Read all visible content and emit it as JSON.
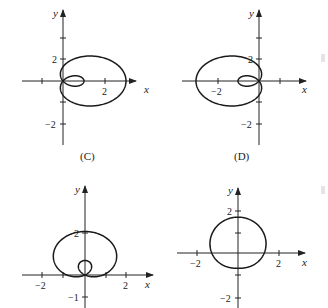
{
  "chart_data": [
    {
      "type": "line",
      "panel": "top-left",
      "title": "",
      "caption": "(C)",
      "description": "Limaçon with inner loop opening to the right",
      "equation_hint": "r = 1 + 2cos(theta)",
      "xlabel": "x",
      "ylabel": "y",
      "x_ticks": [
        {
          "value": -1,
          "label": ""
        },
        {
          "value": 2,
          "label": "2"
        }
      ],
      "y_ticks": [
        {
          "value": 4,
          "label": ""
        },
        {
          "value": 2,
          "label": "2"
        },
        {
          "value": -2,
          "label": "-2"
        },
        {
          "value": -4,
          "label": ""
        }
      ],
      "xlim": [
        -2,
        3.5
      ],
      "ylim": [
        -3,
        3
      ],
      "grid": false
    },
    {
      "type": "line",
      "panel": "top-right",
      "title": "",
      "caption": "(D)",
      "description": "Limaçon with inner loop opening to the left",
      "equation_hint": "r = 1 - 2cos(theta)",
      "xlabel": "x",
      "ylabel": "y",
      "x_ticks": [
        {
          "value": -2,
          "label": "-2"
        },
        {
          "value": 1,
          "label": ""
        }
      ],
      "y_ticks": [
        {
          "value": 4,
          "label": ""
        },
        {
          "value": 2,
          "label": "2"
        },
        {
          "value": -2,
          "label": "-2"
        },
        {
          "value": -4,
          "label": ""
        }
      ],
      "xlim": [
        -3.5,
        2
      ],
      "ylim": [
        -3,
        3
      ],
      "grid": false
    },
    {
      "type": "line",
      "panel": "bottom-left",
      "title": "",
      "caption": "",
      "description": "Limaçon with inner loop opening upward",
      "equation_hint": "r = 1 + 2sin(theta)",
      "xlabel": "x",
      "ylabel": "y",
      "x_ticks": [
        {
          "value": -2,
          "label": "-2"
        },
        {
          "value": -1,
          "label": ""
        },
        {
          "value": 1,
          "label": ""
        },
        {
          "value": 2,
          "label": "2"
        }
      ],
      "y_ticks": [
        {
          "value": 2,
          "label": "2"
        },
        {
          "value": -1,
          "label": "-1"
        }
      ],
      "xlim": [
        -2.5,
        3
      ],
      "ylim": [
        -1.5,
        3.2
      ],
      "grid": false
    },
    {
      "type": "line",
      "panel": "bottom-right",
      "title": "",
      "caption": "",
      "description": "Dimpled limaçon, dimple at bottom",
      "equation_hint": "r = 1.25 + 0.5sin(theta) (approx)",
      "xlabel": "x",
      "ylabel": "y",
      "x_ticks": [
        {
          "value": -2,
          "label": "-2"
        },
        {
          "value": 2,
          "label": "2"
        }
      ],
      "y_ticks": [
        {
          "value": 2,
          "label": "2"
        },
        {
          "value": 1,
          "label": ""
        },
        {
          "value": -1,
          "label": ""
        },
        {
          "value": -2,
          "label": "-2"
        }
      ],
      "xlim": [
        -3,
        3
      ],
      "ylim": [
        -2.5,
        3
      ],
      "grid": false
    }
  ],
  "labels": {
    "x": "x",
    "y": "y",
    "caption_c": "(C)",
    "caption_d": "(D)",
    "tl_x2": "2",
    "tl_y2": "2",
    "tl_ym2": "−2",
    "tr_xm2": "−2",
    "tr_y2": "2",
    "tr_ym2": "−2",
    "bl_xm2": "−2",
    "bl_x2": "2",
    "bl_y2": "2",
    "bl_ym1": "−1",
    "br_xm2": "−2",
    "br_x2": "2",
    "br_y2": "2",
    "br_ym2": "−2"
  }
}
